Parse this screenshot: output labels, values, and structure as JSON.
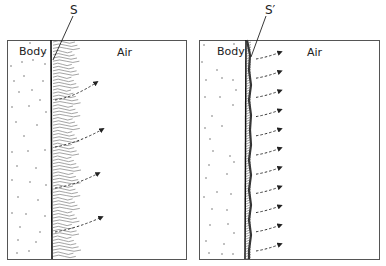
{
  "panels": [
    {
      "id": "left",
      "surface_label": "S",
      "region_left_label": "Body",
      "region_right_label": "Air",
      "boundary_layer": "thick wavy boundary layer",
      "arrow_count": 4
    },
    {
      "id": "right",
      "surface_label": "S′",
      "region_left_label": "Body",
      "region_right_label": "Air",
      "boundary_layer": "thin hatched boundary layer",
      "arrow_count": 11
    }
  ],
  "colors": {
    "ink": "#222222",
    "frame": "#555555",
    "background": "#ffffff"
  }
}
